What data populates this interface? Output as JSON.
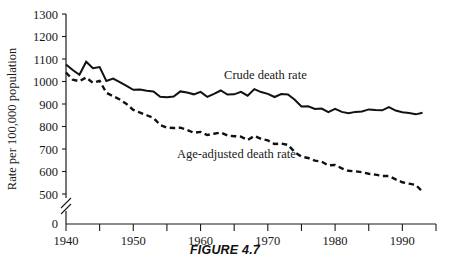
{
  "figure": {
    "caption": "FIGURE 4.7"
  },
  "chart_data": {
    "type": "line",
    "title": "",
    "subtitle": "",
    "xlabel": "",
    "ylabel": "Rate per 100,000 population",
    "xlim": [
      1940,
      1995
    ],
    "ylim": [
      500,
      1300
    ],
    "y_axis_break": true,
    "y_break_label": "0",
    "grid": false,
    "legend_position": "inline-annotations",
    "xticks_major": [
      1940,
      1950,
      1960,
      1970,
      1980,
      1990
    ],
    "xticks_major_labels": [
      "1940",
      "1950",
      "1960",
      "1970",
      "1980",
      "1990"
    ],
    "xticks_minor": [
      1945,
      1955,
      1965,
      1975,
      1985,
      1995
    ],
    "yticks": [
      500,
      600,
      700,
      800,
      900,
      1000,
      1100,
      1200,
      1300
    ],
    "ytick_labels": [
      "500",
      "600",
      "700",
      "800",
      "900",
      "1000",
      "1100",
      "1200",
      "1300"
    ],
    "annotations": [
      {
        "name": "crude-death-rate-label",
        "text": "Crude death rate",
        "x": 1963.5,
        "y": 1012
      },
      {
        "name": "age-adjusted-death-rate-label",
        "text": "Age-adjusted death rate",
        "x": 1956.5,
        "y": 662
      }
    ],
    "x": [
      1940,
      1941,
      1942,
      1943,
      1944,
      1945,
      1946,
      1947,
      1948,
      1949,
      1950,
      1951,
      1952,
      1953,
      1954,
      1955,
      1956,
      1957,
      1958,
      1959,
      1960,
      1961,
      1962,
      1963,
      1964,
      1965,
      1966,
      1967,
      1968,
      1969,
      1970,
      1971,
      1972,
      1973,
      1974,
      1975,
      1976,
      1977,
      1978,
      1979,
      1980,
      1981,
      1982,
      1983,
      1984,
      1985,
      1986,
      1987,
      1988,
      1989,
      1990,
      1991,
      1992,
      1993
    ],
    "series": [
      {
        "name": "Crude death rate",
        "style": "solid",
        "color": "#111111",
        "values": [
          1076,
          1051,
          1030,
          1088,
          1059,
          1064,
          1002,
          1013,
          997,
          981,
          963,
          964,
          959,
          956,
          932,
          930,
          933,
          956,
          951,
          943,
          954,
          932,
          945,
          960,
          942,
          943,
          954,
          937,
          966,
          953,
          945,
          931,
          944,
          942,
          919,
          889,
          890,
          878,
          880,
          864,
          878,
          865,
          859,
          865,
          867,
          876,
          873,
          872,
          886,
          871,
          863,
          860,
          854,
          861
        ]
      },
      {
        "name": "Age-adjusted death rate",
        "style": "dashed",
        "color": "#111111",
        "values": [
          1040,
          1008,
          1001,
          1018,
          994,
          1003,
          950,
          935,
          920,
          900,
          874,
          862,
          850,
          838,
          807,
          795,
          793,
          795,
          785,
          772,
          776,
          762,
          768,
          773,
          760,
          757,
          755,
          740,
          758,
          745,
          738,
          722,
          724,
          718,
          686,
          666,
          660,
          648,
          644,
          627,
          629,
          614,
          603,
          601,
          597,
          590,
          586,
          580,
          580,
          565,
          552,
          546,
          540,
          510
        ]
      }
    ]
  }
}
